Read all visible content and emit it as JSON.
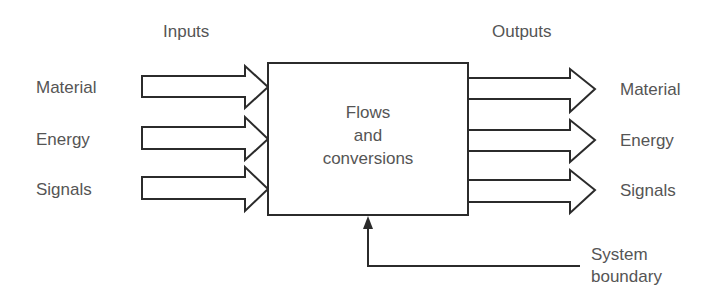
{
  "diagram": {
    "headers": {
      "inputs": "Inputs",
      "outputs": "Outputs"
    },
    "inputs": [
      {
        "label": "Material"
      },
      {
        "label": "Energy"
      },
      {
        "label": "Signals"
      }
    ],
    "outputs": [
      {
        "label": "Material"
      },
      {
        "label": "Energy"
      },
      {
        "label": "Signals"
      }
    ],
    "box": {
      "lines": [
        "Flows",
        "and",
        "conversions"
      ]
    },
    "boundary": {
      "lines": [
        "System",
        "boundary"
      ]
    },
    "colors": {
      "text": "#555555",
      "stroke": "#2b2b2b",
      "background": "#ffffff"
    }
  }
}
